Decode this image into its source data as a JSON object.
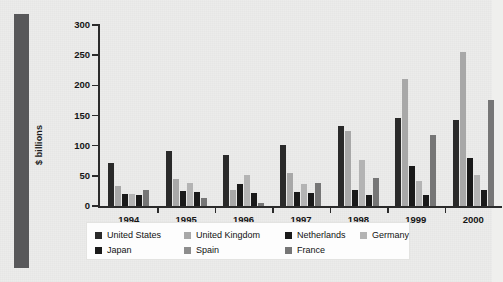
{
  "chart_data": {
    "type": "bar",
    "title": "",
    "subtitle": "",
    "xlabel": "",
    "ylabel": "$ billions",
    "ylim": [
      0,
      300
    ],
    "yticks": [
      0,
      50,
      100,
      150,
      200,
      250,
      300
    ],
    "grid": false,
    "legend_position": "bottom",
    "categories": [
      "1994",
      "1995",
      "1996",
      "1997",
      "1998",
      "1999",
      "2000"
    ],
    "series": [
      {
        "name": "United States",
        "color": "#2a2a2a",
        "values": [
          72,
          92,
          85,
          101,
          133,
          146,
          143
        ]
      },
      {
        "name": "United Kingdom",
        "color": "#a8a8a8",
        "values": [
          33,
          45,
          27,
          55,
          124,
          210,
          255
        ]
      },
      {
        "name": "Netherlands",
        "color": "#1a1a1a",
        "values": [
          20,
          25,
          36,
          23,
          27,
          67,
          79
        ]
      },
      {
        "name": "Germany",
        "color": "#b4b4b4",
        "values": [
          20,
          38,
          52,
          37,
          77,
          41,
          52
        ]
      },
      {
        "name": "Japan",
        "color": "#1a1a1a",
        "values": [
          18,
          23,
          22,
          22,
          18,
          18,
          27
        ]
      },
      {
        "name": "France",
        "color": "#767676",
        "values": [
          26,
          13,
          5,
          38,
          47,
          118,
          176
        ]
      }
    ]
  },
  "axis": {
    "ylabel": "$ billions",
    "tick_labels": [
      "300",
      "250",
      "200",
      "150",
      "100",
      "50",
      "0"
    ],
    "x_labels": [
      "1994",
      "1995",
      "1996",
      "1997",
      "1998",
      "1999",
      "2000"
    ]
  },
  "legend": {
    "row1": [
      {
        "label": "United States",
        "color": "#2a2a2a"
      },
      {
        "label": "United Kingdom",
        "color": "#a8a8a8"
      },
      {
        "label": "Netherlands",
        "color": "#1a1a1a"
      },
      {
        "label": "Germany",
        "color": "#b4b4b4"
      }
    ],
    "row2": [
      {
        "label": "Japan",
        "color": "#1a1a1a"
      },
      {
        "label": "Spain",
        "color": "#8d8d8d"
      },
      {
        "label": "France",
        "color": "#767676"
      }
    ]
  },
  "colors": {
    "page_background": "#ececeb",
    "spine": "#58585a",
    "axis": "#2b2b2b",
    "legend_background": "#fdfdfd"
  }
}
